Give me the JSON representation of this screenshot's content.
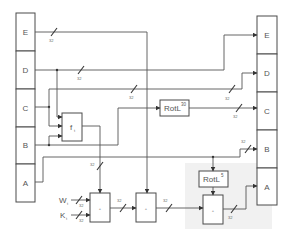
{
  "diagram": {
    "input_registers": [
      "E",
      "D",
      "C",
      "B",
      "A"
    ],
    "output_registers": [
      "E",
      "D",
      "C",
      "B",
      "A"
    ],
    "function_box": {
      "label": "f",
      "sub": "t"
    },
    "rotl30": {
      "label": "RotL",
      "sup": "30"
    },
    "rotl5": {
      "label": "RotL",
      "sup": "5"
    },
    "adder_symbol": "+",
    "w_input": {
      "label": "W",
      "sub": "t"
    },
    "k_input": {
      "label": "K",
      "sub": "t"
    },
    "bus_width": "32",
    "colors": {
      "line": "#555555",
      "box_border": "#4a4a4a",
      "shade": "#f1f1f1",
      "background": "#ffffff"
    }
  }
}
